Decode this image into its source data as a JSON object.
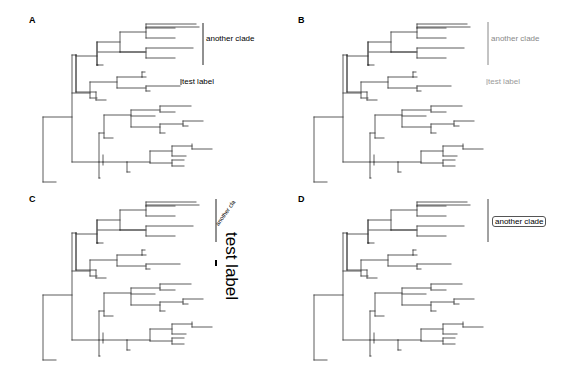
{
  "figure": {
    "panels": [
      {
        "id": "A",
        "letter": "A",
        "x": 0,
        "y": 0,
        "letter_pos": [
          29,
          15
        ],
        "tree_color": "#333333",
        "tree_dx": 0,
        "tree_dy": 0,
        "clade_bar": {
          "x": 203,
          "y1": 23,
          "y2": 65,
          "color": "#222222"
        },
        "clade_label": {
          "text": "another clade",
          "x": 206,
          "y": 39,
          "color": "#000000",
          "style": "plain"
        },
        "tip_label": {
          "text": "test label",
          "x": 182,
          "y": 82,
          "color": "#000000",
          "bar": true
        }
      },
      {
        "id": "B",
        "letter": "B",
        "x": 282,
        "y": 0,
        "letter_pos": [
          16,
          15
        ],
        "tree_color": "#333333",
        "tree_dx": -11,
        "tree_dy": 0,
        "clade_bar": {
          "x": 206,
          "y1": 22,
          "y2": 65,
          "color": "#888888"
        },
        "clade_label": {
          "text": "another clade",
          "x": 209,
          "y": 39,
          "color": "#888888",
          "style": "plain"
        },
        "tip_label": {
          "text": "test label",
          "x": 206,
          "y": 82,
          "color": "#999999",
          "bar": true
        }
      },
      {
        "id": "C",
        "letter": "C",
        "x": 0,
        "y": 190,
        "letter_pos": [
          29,
          4
        ],
        "tree_color": "#333333",
        "tree_dx": 0,
        "tree_dy": -12,
        "clade_bar": {
          "x": 216,
          "y1": 9,
          "y2": 52,
          "color": "#222222"
        },
        "clade_label": {
          "text": "another clade",
          "x": 221,
          "y": 30,
          "color": "#000000",
          "style": "rotated45"
        },
        "tip_label": {
          "text": "test label",
          "x": 226,
          "y": 42,
          "color": "#000000",
          "bar": true,
          "style": "rotated90-large"
        }
      },
      {
        "id": "D",
        "letter": "D",
        "x": 282,
        "y": 190,
        "letter_pos": [
          16,
          4
        ],
        "tree_color": "#333333",
        "tree_dx": -11,
        "tree_dy": -12,
        "clade_bar": {
          "x": 206,
          "y1": 9,
          "y2": 52,
          "color": "#444444"
        },
        "clade_label": {
          "text": "another clade",
          "x": 210,
          "y": 27,
          "color": "#000000",
          "style": "boxed"
        },
        "tip_label": null
      }
    ]
  },
  "tree": {
    "segments": [
      [
        43,
        117,
        43,
        182
      ],
      [
        43,
        117,
        72,
        117
      ],
      [
        43,
        182,
        56,
        182
      ],
      [
        72,
        55,
        72,
        162
      ],
      [
        72,
        55,
        76,
        55
      ],
      [
        76,
        55,
        76,
        92
      ],
      [
        76,
        92,
        96,
        92
      ],
      [
        96,
        92,
        96,
        100
      ],
      [
        96,
        100,
        106,
        100
      ],
      [
        76,
        55,
        76,
        55
      ],
      [
        76,
        55,
        76,
        92
      ],
      [
        76,
        56,
        97,
        56
      ],
      [
        97,
        42,
        97,
        65
      ],
      [
        97,
        65,
        98,
        65
      ],
      [
        97,
        42,
        120,
        42
      ],
      [
        120,
        32,
        120,
        52
      ],
      [
        120,
        32,
        146,
        32
      ],
      [
        146,
        28,
        146,
        38
      ],
      [
        146,
        28,
        175,
        28
      ],
      [
        146,
        38,
        175,
        38
      ],
      [
        146,
        24,
        146,
        28
      ],
      [
        146,
        24,
        196,
        24
      ],
      [
        146,
        27,
        199,
        27
      ],
      [
        120,
        52,
        145,
        52
      ],
      [
        97,
        65,
        103,
        65
      ],
      [
        97,
        42,
        97,
        65
      ],
      [
        98,
        52,
        120,
        52
      ],
      [
        120,
        52,
        146,
        52
      ],
      [
        146,
        48,
        146,
        58
      ],
      [
        146,
        48,
        193,
        48
      ],
      [
        146,
        58,
        175,
        58
      ],
      [
        97,
        65,
        97,
        65
      ],
      [
        72,
        93,
        90,
        93
      ],
      [
        90,
        82,
        90,
        98
      ],
      [
        90,
        82,
        117,
        82
      ],
      [
        117,
        77,
        117,
        88
      ],
      [
        117,
        77,
        142,
        77
      ],
      [
        142,
        72,
        142,
        77
      ],
      [
        142,
        72,
        145,
        72
      ],
      [
        142,
        77,
        146,
        77
      ],
      [
        117,
        88,
        146,
        88
      ],
      [
        146,
        86,
        146,
        91
      ],
      [
        146,
        86,
        180,
        86
      ],
      [
        146,
        91,
        150,
        91
      ],
      [
        90,
        98,
        97,
        98
      ],
      [
        72,
        162,
        99,
        162
      ],
      [
        99,
        133,
        99,
        178
      ],
      [
        99,
        133,
        104,
        133
      ],
      [
        104,
        115,
        104,
        138
      ],
      [
        104,
        138,
        113,
        138
      ],
      [
        104,
        115,
        131,
        115
      ],
      [
        131,
        110,
        131,
        127
      ],
      [
        131,
        110,
        160,
        110
      ],
      [
        160,
        106,
        160,
        112
      ],
      [
        160,
        106,
        191,
        106
      ],
      [
        160,
        112,
        175,
        112
      ],
      [
        131,
        116,
        155,
        116
      ],
      [
        131,
        127,
        160,
        127
      ],
      [
        160,
        124,
        160,
        133
      ],
      [
        160,
        124,
        183,
        124
      ],
      [
        183,
        121,
        183,
        126
      ],
      [
        183,
        121,
        203,
        121
      ],
      [
        183,
        126,
        188,
        126
      ],
      [
        160,
        133,
        165,
        133
      ],
      [
        99,
        178,
        100,
        178
      ],
      [
        103,
        162,
        127,
        162
      ],
      [
        127,
        162,
        127,
        172
      ],
      [
        127,
        172,
        130,
        172
      ],
      [
        127,
        162,
        150,
        162
      ],
      [
        150,
        151,
        150,
        163
      ],
      [
        150,
        151,
        172,
        151
      ],
      [
        172,
        146,
        172,
        156
      ],
      [
        172,
        146,
        192,
        146
      ],
      [
        192,
        144,
        192,
        149
      ],
      [
        192,
        149,
        212,
        149
      ],
      [
        172,
        156,
        186,
        156
      ],
      [
        150,
        163,
        172,
        163
      ],
      [
        172,
        160,
        172,
        166
      ],
      [
        172,
        160,
        184,
        160
      ],
      [
        172,
        166,
        184,
        166
      ],
      [
        99,
        162,
        103,
        162
      ],
      [
        103,
        155,
        103,
        165
      ]
    ]
  }
}
